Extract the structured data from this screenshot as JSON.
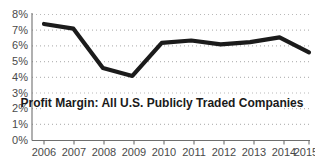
{
  "chart_data": {
    "type": "line",
    "title": "Profit Margin: All U.S. Publicly Traded Companies",
    "xlabel": "",
    "ylabel": "",
    "categories": [
      "2006",
      "2007",
      "2008",
      "2009",
      "2010",
      "2011",
      "2012",
      "2013",
      "2014",
      "2015"
    ],
    "values": [
      7.4,
      7.1,
      4.6,
      4.1,
      6.2,
      6.35,
      6.1,
      6.25,
      6.55,
      5.6
    ],
    "series": [
      {
        "name": "Profit Margin",
        "values": [
          7.4,
          7.1,
          4.6,
          4.1,
          6.2,
          6.35,
          6.1,
          6.25,
          6.55,
          5.6
        ]
      }
    ],
    "ylim": [
      0,
      8
    ],
    "ytick_labels": [
      "0%",
      "1%",
      "2%",
      "3%",
      "4%",
      "5%",
      "6%",
      "7%",
      "8%"
    ],
    "ytick_values": [
      0,
      1,
      2,
      3,
      4,
      5,
      6,
      7,
      8
    ],
    "xtick_labels": [
      "2006",
      "2007",
      "2008",
      "2009",
      "2010",
      "2011",
      "2012",
      "2013",
      "2014",
      "2015"
    ],
    "grid": true,
    "grid_style": "dotted-horizontal",
    "legend": false,
    "legend_position": "none",
    "line_color": "#1b1b1b",
    "grid_color": "#b9b9b9",
    "axis_color": "#6f6f6f",
    "tick_label_color": "#4a4a4a",
    "title_color": "#1a1a1a",
    "background_color": "#ffffff"
  }
}
